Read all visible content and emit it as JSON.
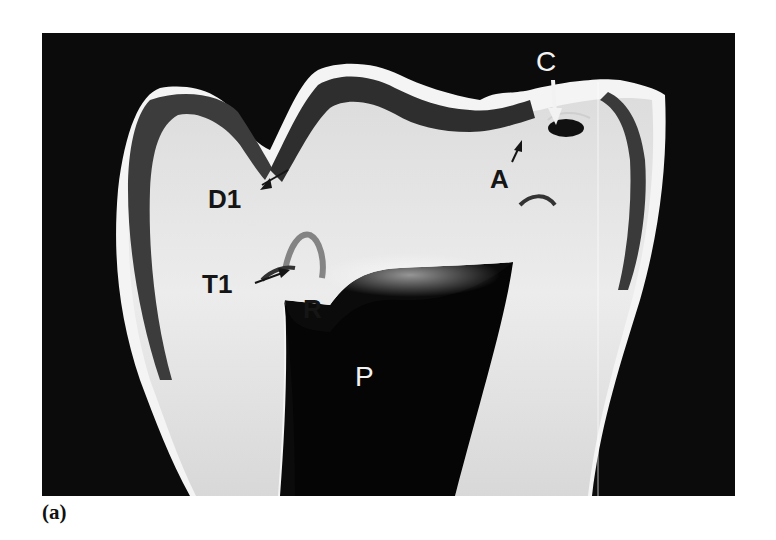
{
  "figure": {
    "caption": "(a)",
    "colors": {
      "background": "#0b0b0b",
      "dentin": "#e4e4e4",
      "enamel": "#3a3a3a",
      "pulp": "#050505",
      "page": "#ffffff"
    },
    "labels": [
      {
        "id": "D1",
        "text": "D1",
        "x": 208,
        "y": 186,
        "size": 26,
        "tone": "dark"
      },
      {
        "id": "T1",
        "text": "T1",
        "x": 202,
        "y": 271,
        "size": 26,
        "tone": "dark"
      },
      {
        "id": "R",
        "text": "R",
        "x": 303,
        "y": 296,
        "size": 26,
        "tone": "dark"
      },
      {
        "id": "A",
        "text": "A",
        "x": 490,
        "y": 166,
        "size": 26,
        "tone": "dark"
      },
      {
        "id": "C",
        "text": "C",
        "x": 536,
        "y": 50,
        "size": 28,
        "tone": "light"
      },
      {
        "id": "P",
        "text": "P",
        "x": 355,
        "y": 365,
        "size": 28,
        "tone": "light"
      }
    ]
  }
}
